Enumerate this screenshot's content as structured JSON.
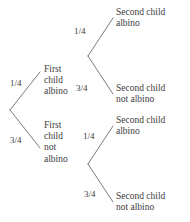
{
  "diagram": {
    "type": "probability-tree",
    "title": "",
    "background_color": "#ffffff",
    "line_color": "#6b6b6b",
    "text_color": "#3d3d3d",
    "root": {
      "branches": [
        {
          "probability": "1/4",
          "node_lines": [
            "First",
            "child",
            "albino"
          ],
          "children": [
            {
              "probability": "1/4",
              "leaf_lines": [
                "Second child",
                "albino"
              ]
            },
            {
              "probability": "3/4",
              "leaf_lines": [
                "Second child",
                "not albino"
              ]
            }
          ]
        },
        {
          "probability": "3/4",
          "node_lines": [
            "First",
            "child",
            "not",
            "albino"
          ],
          "children": [
            {
              "probability": "1/4",
              "leaf_lines": [
                "Second child",
                "albino"
              ]
            },
            {
              "probability": "3/4",
              "leaf_lines": [
                "Second child",
                "not albino"
              ]
            }
          ]
        }
      ]
    }
  }
}
